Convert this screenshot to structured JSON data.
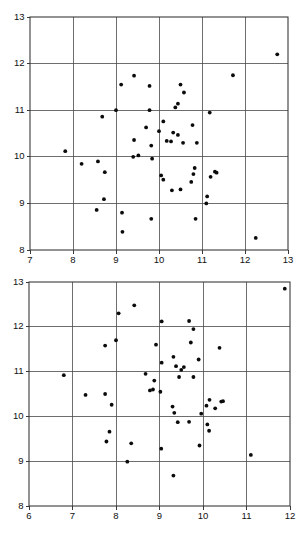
{
  "figure": {
    "type": "scatter-panel-pair",
    "background": "#ffffff",
    "point_color": "#0b0b0b",
    "grid_color": "#4a4a4a",
    "axis_color": "#3a3a3a"
  },
  "chart_data": [
    {
      "panel": "top",
      "type": "scatter",
      "title": "",
      "xlabel": "",
      "ylabel": "",
      "xlim": [
        7,
        13
      ],
      "ylim": [
        8,
        13
      ],
      "xticks": [
        7,
        8,
        9,
        10,
        11,
        12,
        13
      ],
      "yticks": [
        8,
        9,
        10,
        11,
        12,
        13
      ],
      "xtick_labels": [
        "7",
        "8",
        "9",
        "10",
        "11",
        "12",
        "13"
      ],
      "ytick_labels": [
        "8",
        "9",
        "10",
        "11",
        "12",
        "13"
      ],
      "grid": true,
      "legend": null,
      "marker": "filled-circle",
      "n_points": 57,
      "points": [
        [
          12.75,
          12.2
        ],
        [
          11.72,
          11.75
        ],
        [
          9.42,
          11.74
        ],
        [
          9.12,
          11.55
        ],
        [
          9.78,
          11.52
        ],
        [
          10.5,
          11.55
        ],
        [
          10.58,
          11.38
        ],
        [
          10.44,
          11.14
        ],
        [
          10.38,
          11.06
        ],
        [
          9.0,
          11.0
        ],
        [
          9.78,
          11.0
        ],
        [
          11.18,
          10.95
        ],
        [
          8.68,
          10.86
        ],
        [
          10.1,
          10.76
        ],
        [
          9.7,
          10.63
        ],
        [
          10.0,
          10.55
        ],
        [
          10.33,
          10.52
        ],
        [
          10.44,
          10.47
        ],
        [
          10.78,
          10.68
        ],
        [
          9.42,
          10.36
        ],
        [
          10.18,
          10.34
        ],
        [
          10.28,
          10.33
        ],
        [
          10.56,
          10.3
        ],
        [
          10.88,
          10.3
        ],
        [
          9.82,
          10.24
        ],
        [
          7.82,
          10.12
        ],
        [
          9.4,
          10.0
        ],
        [
          9.52,
          10.03
        ],
        [
          9.84,
          9.96
        ],
        [
          10.83,
          9.76
        ],
        [
          8.2,
          9.85
        ],
        [
          8.58,
          9.9
        ],
        [
          11.3,
          9.68
        ],
        [
          11.34,
          9.66
        ],
        [
          8.74,
          9.67
        ],
        [
          10.8,
          9.63
        ],
        [
          10.05,
          9.6
        ],
        [
          10.1,
          9.51
        ],
        [
          11.2,
          9.57
        ],
        [
          10.75,
          9.46
        ],
        [
          10.3,
          9.28
        ],
        [
          10.5,
          9.3
        ],
        [
          11.12,
          9.15
        ],
        [
          8.72,
          9.09
        ],
        [
          11.1,
          9.0
        ],
        [
          8.55,
          8.86
        ],
        [
          9.14,
          8.8
        ],
        [
          9.82,
          8.67
        ],
        [
          10.85,
          8.67
        ],
        [
          9.15,
          8.39
        ],
        [
          12.25,
          8.26
        ]
      ]
    },
    {
      "panel": "bottom",
      "type": "scatter",
      "title": "",
      "xlabel": "",
      "ylabel": "",
      "xlim": [
        6,
        12
      ],
      "ylim": [
        8,
        13
      ],
      "xticks": [
        6,
        7,
        8,
        9,
        10,
        11,
        12
      ],
      "yticks": [
        8,
        9,
        10,
        11,
        12,
        13
      ],
      "xtick_labels": [
        "6",
        "7",
        "8",
        "9",
        "10",
        "11",
        "12"
      ],
      "ytick_labels": [
        "8",
        "9",
        "10",
        "11",
        "12",
        "13"
      ],
      "grid": true,
      "legend": null,
      "marker": "filled-circle",
      "n_points": 57,
      "points": [
        [
          11.88,
          12.85
        ],
        [
          8.42,
          12.48
        ],
        [
          8.06,
          12.3
        ],
        [
          9.05,
          12.12
        ],
        [
          9.68,
          12.13
        ],
        [
          9.78,
          11.95
        ],
        [
          8.0,
          11.7
        ],
        [
          7.75,
          11.58
        ],
        [
          8.92,
          11.6
        ],
        [
          9.72,
          11.65
        ],
        [
          10.38,
          11.53
        ],
        [
          9.32,
          11.33
        ],
        [
          9.9,
          11.27
        ],
        [
          9.05,
          11.2
        ],
        [
          9.38,
          11.12
        ],
        [
          9.56,
          11.1
        ],
        [
          9.5,
          11.04
        ],
        [
          8.68,
          10.95
        ],
        [
          9.45,
          10.88
        ],
        [
          9.78,
          10.88
        ],
        [
          6.8,
          10.92
        ],
        [
          8.88,
          10.8
        ],
        [
          8.85,
          10.6
        ],
        [
          8.78,
          10.58
        ],
        [
          9.02,
          10.55
        ],
        [
          7.3,
          10.48
        ],
        [
          7.75,
          10.5
        ],
        [
          10.15,
          10.37
        ],
        [
          10.42,
          10.33
        ],
        [
          10.46,
          10.34
        ],
        [
          7.9,
          10.26
        ],
        [
          10.08,
          10.24
        ],
        [
          9.3,
          10.22
        ],
        [
          10.28,
          10.18
        ],
        [
          9.34,
          10.08
        ],
        [
          9.96,
          10.06
        ],
        [
          9.42,
          9.87
        ],
        [
          9.68,
          9.88
        ],
        [
          10.1,
          9.82
        ],
        [
          7.85,
          9.66
        ],
        [
          10.14,
          9.68
        ],
        [
          7.78,
          9.44
        ],
        [
          8.35,
          9.4
        ],
        [
          9.92,
          9.35
        ],
        [
          9.04,
          9.28
        ],
        [
          11.1,
          9.14
        ],
        [
          8.26,
          8.99
        ],
        [
          9.32,
          8.68
        ]
      ]
    }
  ]
}
